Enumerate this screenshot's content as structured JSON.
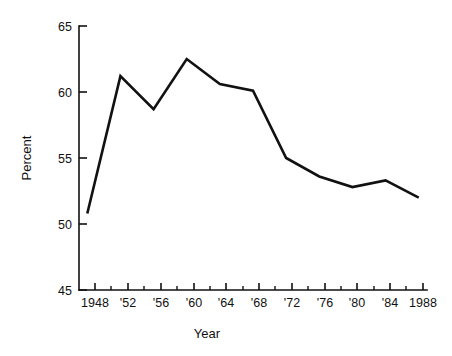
{
  "chart_data": {
    "type": "line",
    "title": "",
    "subtitle": "",
    "xlabel": "Year",
    "ylabel": "Percent",
    "x": [
      1948,
      1952,
      1956,
      1960,
      1964,
      1968,
      1972,
      1976,
      1980,
      1984,
      1988
    ],
    "values": [
      50.8,
      61.2,
      58.7,
      62.5,
      60.6,
      60.1,
      55.0,
      53.6,
      52.8,
      53.3,
      52.0
    ],
    "series": [
      {
        "name": "Percent",
        "values": [
          50.8,
          61.2,
          58.7,
          62.5,
          60.6,
          60.1,
          55.0,
          53.6,
          52.8,
          53.3,
          52.0
        ]
      }
    ],
    "x_tick_labels": [
      "1948",
      "'52",
      "'56",
      "'60",
      "'64",
      "'68",
      "'72",
      "'76",
      "'80",
      "'84",
      "1988"
    ],
    "x_minor_ticks": [
      1950,
      1954,
      1958,
      1962,
      1966,
      1970,
      1974,
      1978,
      1982,
      1986
    ],
    "y_tick_labels": [
      "45",
      "50",
      "55",
      "60",
      "65"
    ],
    "y_ticks": [
      45,
      50,
      55,
      60,
      65
    ],
    "xlim": [
      1947,
      1989
    ],
    "ylim": [
      45,
      65
    ],
    "grid": false,
    "legend": false,
    "legend_position": "none",
    "line_color": "#111111",
    "background_color": "#ffffff"
  },
  "axes": {
    "y_title": "Percent",
    "x_title": "Year"
  }
}
